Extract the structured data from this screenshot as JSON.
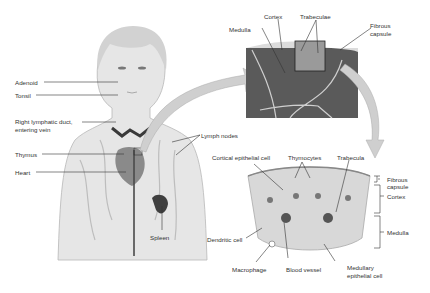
{
  "figure": {
    "body_labels": {
      "adenoid": "Adenoid",
      "tonsil": "Tonsil",
      "right_lymphatic_duct_line1": "Right lymphatic duct,",
      "right_lymphatic_duct_line2": "entering vein",
      "thymus": "Thymus",
      "heart": "Heart",
      "lymph_nodes": "Lymph nodes",
      "spleen": "Spleen"
    },
    "lymph_node_labels": {
      "medulla": "Medulla",
      "cortex": "Cortex",
      "trabeculae": "Trabeculae",
      "fibrous_capsule_line1": "Fibrous",
      "fibrous_capsule_line2": "capsule"
    },
    "thymus_labels": {
      "cortical_epithelial_cell": "Cortical epithelial cell",
      "thymocytes": "Thymocytes",
      "trabecula": "Trabecula",
      "fibrous_capsule_line1": "Fibrous",
      "fibrous_capsule_line2": "capsule",
      "cortex": "Cortex",
      "medulla": "Medulla",
      "dendritic_cell": "Dendritic cell",
      "macrophage": "Macrophage",
      "blood_vessel": "Blood vessel",
      "medullary_epithelial_line1": "Medullary",
      "medullary_epithelial_line2": "epithelial cell"
    },
    "colors": {
      "background": "#ffffff",
      "skin": "#e6e6e6",
      "tissue_dark": "#5a5a5a",
      "vessel": "#3a3a3a",
      "arrow": "#c8c8c8",
      "label_text": "#333333"
    }
  }
}
